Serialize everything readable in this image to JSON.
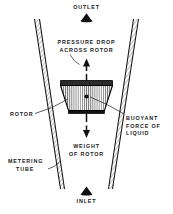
{
  "diagram": {
    "background_color": "#ffffff",
    "ink_color": "#1a1a1a",
    "labels": {
      "outlet": "OUTLET",
      "inlet": "INLET",
      "pressure_drop_line1": "PRESSURE DROP",
      "pressure_drop_line2": "ACROSS ROTOR",
      "rotor": "ROTOR",
      "buoyant_line1": "BUOYANT",
      "buoyant_line2": "FORCE OF",
      "buoyant_line3": "LIQUID",
      "weight_line1": "WEIGHT",
      "weight_line2": "OF ROTOR",
      "metering_line1": "METERING",
      "metering_line2": "TUBE"
    },
    "icons": {
      "outlet_marker": "triangle-up-icon",
      "inlet_marker": "triangle-up-icon",
      "pressure_arrow": "arrow-up-icon",
      "weight_arrow": "arrow-down-icon",
      "rotor_center": "center-dot-icon"
    }
  }
}
